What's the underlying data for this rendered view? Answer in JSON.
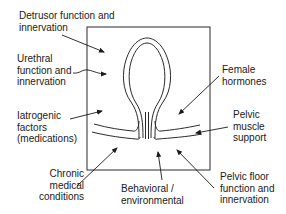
{
  "diagram": {
    "labels": {
      "detrusor": "Detrusor function and\ninnervation",
      "urethral": "Urethral\nfunction and\ninnervation",
      "iatrogenic": "Iatrogenic\nfactors\n(medications)",
      "chronic": "Chronic\nmedical\nconditions",
      "behavioral": "Behavioral /\nenvironmental",
      "pelvic_floor": "Pelvic floor\nfunction and\ninnervation",
      "pelvic_muscle": "Pelvic\nmuscle\nsupport",
      "hormones": "Female\nhormones"
    },
    "colors": {
      "line": "#2a2a2a",
      "text": "#1a1a1a",
      "background": "#ffffff"
    }
  }
}
